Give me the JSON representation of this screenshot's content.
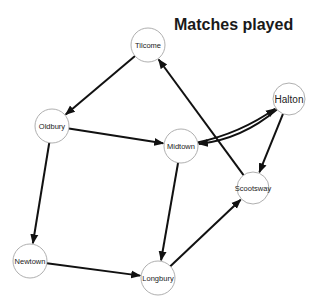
{
  "title": "Matches played",
  "colors": {
    "edge": "#111111",
    "node_stroke": "#9a9a9a",
    "node_fill": "#ffffff",
    "text": "#222222"
  },
  "nodes": [
    {
      "id": "Tilcome",
      "label": "Tilcome"
    },
    {
      "id": "Oldbury",
      "label": "Oldbury"
    },
    {
      "id": "Midtown",
      "label": "Midtown"
    },
    {
      "id": "Halton",
      "label": "Halton"
    },
    {
      "id": "Scootsway",
      "label": "Scootsway"
    },
    {
      "id": "Newtown",
      "label": "Newtown"
    },
    {
      "id": "Longbury",
      "label": "Longbury"
    }
  ],
  "edges": [
    {
      "from": "Tilcome",
      "to": "Oldbury"
    },
    {
      "from": "Oldbury",
      "to": "Midtown"
    },
    {
      "from": "Oldbury",
      "to": "Newtown"
    },
    {
      "from": "Newtown",
      "to": "Longbury"
    },
    {
      "from": "Midtown",
      "to": "Longbury"
    },
    {
      "from": "Longbury",
      "to": "Scootsway"
    },
    {
      "from": "Halton",
      "to": "Scootsway"
    },
    {
      "from": "Scootsway",
      "to": "Tilcome"
    },
    {
      "from": "Halton",
      "to": "Midtown"
    },
    {
      "from": "Midtown",
      "to": "Halton"
    }
  ]
}
